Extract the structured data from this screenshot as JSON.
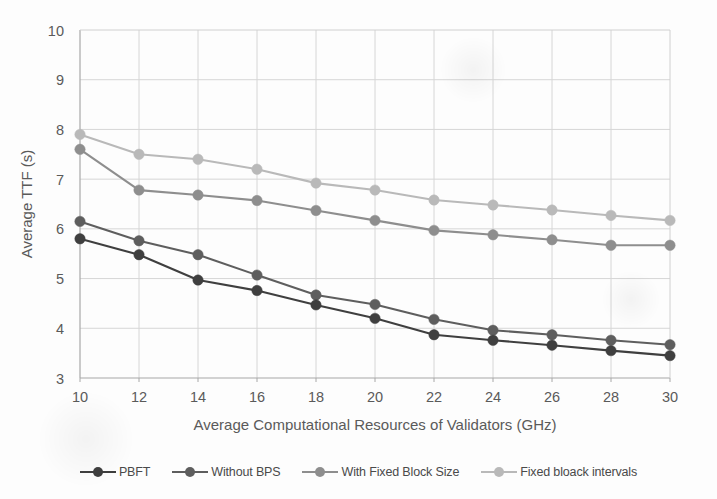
{
  "chart_data": {
    "type": "line",
    "title": "",
    "xlabel": "Average Computational Resources of Validators (GHz)",
    "ylabel": "Average TTF (s)",
    "x": [
      10,
      12,
      14,
      16,
      18,
      20,
      22,
      24,
      26,
      28,
      30
    ],
    "xticklabels": [
      "10",
      "12",
      "14",
      "16",
      "18",
      "20",
      "22",
      "24",
      "26",
      "28",
      "30"
    ],
    "yticklabels": [
      "3",
      "4",
      "5",
      "6",
      "7",
      "8",
      "9",
      "10"
    ],
    "xlim": [
      10,
      30
    ],
    "ylim": [
      3,
      10
    ],
    "grid": true,
    "legend_position": "bottom",
    "series": [
      {
        "name": "PBFT",
        "color": "#3f3f3f",
        "values": [
          5.8,
          5.48,
          4.97,
          4.76,
          4.47,
          4.2,
          3.87,
          3.76,
          3.66,
          3.55,
          3.45
        ]
      },
      {
        "name": "Without BPS",
        "color": "#5e5e5e",
        "values": [
          6.15,
          5.76,
          5.48,
          5.07,
          4.67,
          4.48,
          4.18,
          3.96,
          3.87,
          3.76,
          3.67
        ]
      },
      {
        "name": "With Fixed Block Size",
        "color": "#8e8e8e",
        "values": [
          7.6,
          6.78,
          6.68,
          6.57,
          6.37,
          6.17,
          5.97,
          5.88,
          5.78,
          5.67,
          5.67
        ]
      },
      {
        "name": "Fixed bloack intervals",
        "color": "#b9b9b9",
        "values": [
          7.9,
          7.5,
          7.4,
          7.2,
          6.92,
          6.78,
          6.58,
          6.48,
          6.38,
          6.27,
          6.17
        ]
      }
    ]
  }
}
